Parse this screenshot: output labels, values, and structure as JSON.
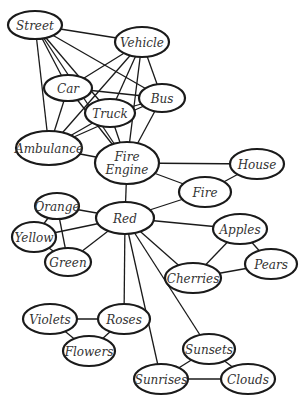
{
  "diagram": {
    "type": "semantic-network",
    "colors": {
      "stroke": "#1a1a1a",
      "fill": "#ffffff",
      "text": "#333333"
    },
    "nodes": [
      {
        "id": "street",
        "lines": [
          "Street"
        ],
        "x": 35,
        "y": 25,
        "rx": 27,
        "ry": 14
      },
      {
        "id": "vehicle",
        "lines": [
          "Vehicle"
        ],
        "x": 142,
        "y": 42,
        "rx": 27,
        "ry": 15
      },
      {
        "id": "car",
        "lines": [
          "Car"
        ],
        "x": 68,
        "y": 88,
        "rx": 24,
        "ry": 13
      },
      {
        "id": "truck",
        "lines": [
          "Truck"
        ],
        "x": 110,
        "y": 113,
        "rx": 25,
        "ry": 14
      },
      {
        "id": "bus",
        "lines": [
          "Bus"
        ],
        "x": 162,
        "y": 98,
        "rx": 23,
        "ry": 14
      },
      {
        "id": "ambulance",
        "lines": [
          "Ambulance"
        ],
        "x": 49,
        "y": 148,
        "rx": 33,
        "ry": 17
      },
      {
        "id": "fire-engine",
        "lines": [
          "Fire",
          "Engine"
        ],
        "x": 127,
        "y": 163,
        "rx": 32,
        "ry": 21
      },
      {
        "id": "house",
        "lines": [
          "House"
        ],
        "x": 257,
        "y": 164,
        "rx": 27,
        "ry": 15
      },
      {
        "id": "fire",
        "lines": [
          "Fire"
        ],
        "x": 205,
        "y": 192,
        "rx": 26,
        "ry": 15
      },
      {
        "id": "orange",
        "lines": [
          "Orange"
        ],
        "x": 57,
        "y": 206,
        "rx": 22,
        "ry": 13
      },
      {
        "id": "red",
        "lines": [
          "Red"
        ],
        "x": 125,
        "y": 218,
        "rx": 29,
        "ry": 16
      },
      {
        "id": "yellow",
        "lines": [
          "Yellow"
        ],
        "x": 34,
        "y": 237,
        "rx": 22,
        "ry": 15
      },
      {
        "id": "green",
        "lines": [
          "Green"
        ],
        "x": 68,
        "y": 262,
        "rx": 23,
        "ry": 14
      },
      {
        "id": "apples",
        "lines": [
          "Apples"
        ],
        "x": 240,
        "y": 229,
        "rx": 27,
        "ry": 15
      },
      {
        "id": "pears",
        "lines": [
          "Pears"
        ],
        "x": 271,
        "y": 264,
        "rx": 26,
        "ry": 15
      },
      {
        "id": "cherries",
        "lines": [
          "Cherries"
        ],
        "x": 193,
        "y": 278,
        "rx": 28,
        "ry": 15
      },
      {
        "id": "violets",
        "lines": [
          "Violets"
        ],
        "x": 50,
        "y": 319,
        "rx": 27,
        "ry": 15
      },
      {
        "id": "roses",
        "lines": [
          "Roses"
        ],
        "x": 124,
        "y": 319,
        "rx": 26,
        "ry": 15
      },
      {
        "id": "flowers",
        "lines": [
          "Flowers"
        ],
        "x": 89,
        "y": 351,
        "rx": 26,
        "ry": 15
      },
      {
        "id": "sunsets",
        "lines": [
          "Sunsets"
        ],
        "x": 209,
        "y": 349,
        "rx": 26,
        "ry": 15
      },
      {
        "id": "sunrises",
        "lines": [
          "Sunrises"
        ],
        "x": 161,
        "y": 379,
        "rx": 27,
        "ry": 15
      },
      {
        "id": "clouds",
        "lines": [
          "Clouds"
        ],
        "x": 248,
        "y": 379,
        "rx": 27,
        "ry": 15
      }
    ],
    "edges": [
      [
        "street",
        "vehicle"
      ],
      [
        "street",
        "car"
      ],
      [
        "street",
        "truck"
      ],
      [
        "street",
        "bus"
      ],
      [
        "street",
        "ambulance"
      ],
      [
        "street",
        "fire-engine"
      ],
      [
        "vehicle",
        "car"
      ],
      [
        "vehicle",
        "truck"
      ],
      [
        "vehicle",
        "bus"
      ],
      [
        "vehicle",
        "ambulance"
      ],
      [
        "vehicle",
        "fire-engine"
      ],
      [
        "car",
        "bus"
      ],
      [
        "car",
        "ambulance"
      ],
      [
        "car",
        "fire-engine"
      ],
      [
        "truck",
        "ambulance"
      ],
      [
        "truck",
        "fire-engine"
      ],
      [
        "bus",
        "truck"
      ],
      [
        "bus",
        "ambulance"
      ],
      [
        "bus",
        "fire-engine"
      ],
      [
        "ambulance",
        "fire-engine"
      ],
      [
        "fire-engine",
        "house"
      ],
      [
        "fire-engine",
        "fire"
      ],
      [
        "fire-engine",
        "red"
      ],
      [
        "fire",
        "house"
      ],
      [
        "fire",
        "red"
      ],
      [
        "red",
        "orange"
      ],
      [
        "red",
        "yellow"
      ],
      [
        "red",
        "green"
      ],
      [
        "red",
        "apples"
      ],
      [
        "red",
        "cherries"
      ],
      [
        "red",
        "roses"
      ],
      [
        "red",
        "sunrises"
      ],
      [
        "red",
        "sunsets"
      ],
      [
        "orange",
        "yellow"
      ],
      [
        "orange",
        "green"
      ],
      [
        "yellow",
        "green"
      ],
      [
        "apples",
        "cherries"
      ],
      [
        "apples",
        "pears"
      ],
      [
        "cherries",
        "pears"
      ],
      [
        "violets",
        "roses"
      ],
      [
        "violets",
        "flowers"
      ],
      [
        "roses",
        "flowers"
      ],
      [
        "sunsets",
        "sunrises"
      ],
      [
        "sunsets",
        "clouds"
      ],
      [
        "sunrises",
        "clouds"
      ]
    ]
  }
}
